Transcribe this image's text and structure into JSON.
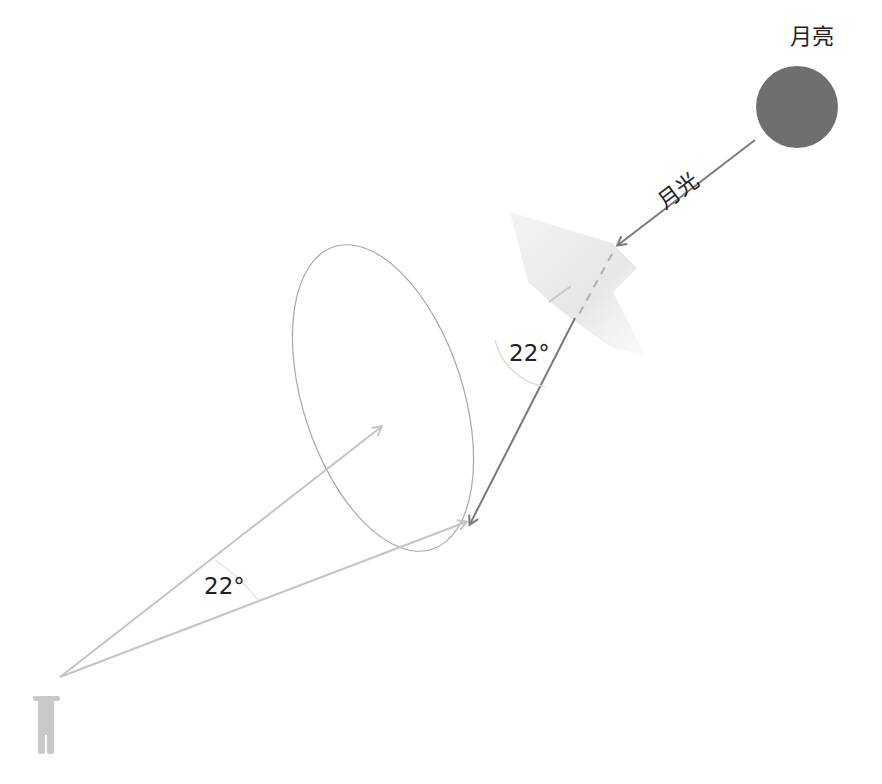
{
  "labels": {
    "moon": "月亮",
    "moonlight": "月光",
    "crystal_angle": "22°",
    "observer_angle": "22°"
  },
  "colors": {
    "moon": "#6f6f6f",
    "moonlight_ray": "#7a7a7a",
    "observer_rays": "#c4c4c4",
    "halo_ellipse": "#a8a8a8",
    "crystal": "#e6e6e6",
    "observer": "#c8c8c8",
    "text": "#222222"
  }
}
